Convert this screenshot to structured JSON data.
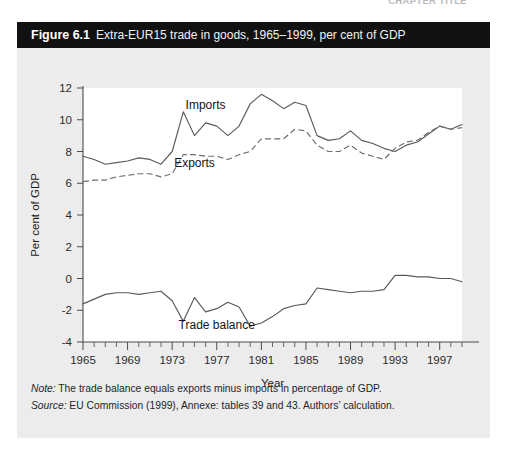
{
  "page_header": {
    "running_head": "CHAPTER TITLE",
    "page_number": ""
  },
  "figure": {
    "number": "Figure 6.1",
    "title": "Extra-EUR15 trade in goods, 1965–1999, per cent of GDP",
    "notes": [
      {
        "lead": "Note:",
        "text": " The trade balance equals exports minus imports in percentage of GDP."
      },
      {
        "lead": "Source:",
        "text": " EU Commission (1999), Annexe: tables 39 and 43. Authors’ calculation."
      }
    ]
  },
  "chart_data": {
    "type": "line",
    "title": "Extra-EUR15 trade in goods, 1965–1999, per cent of GDP",
    "xlabel": "Year",
    "ylabel": "Per cent of GDP",
    "xlim": [
      1965,
      1999
    ],
    "ylim": [
      -4,
      12
    ],
    "yticks": [
      -4,
      -2,
      0,
      2,
      4,
      6,
      8,
      10,
      12
    ],
    "xticks": [
      1965,
      1969,
      1973,
      1977,
      1981,
      1985,
      1989,
      1993,
      1997
    ],
    "xtick_minor_step": 1,
    "grid": false,
    "legend": "inline-annotations",
    "x": [
      1965,
      1966,
      1967,
      1968,
      1969,
      1970,
      1971,
      1972,
      1973,
      1974,
      1975,
      1976,
      1977,
      1978,
      1979,
      1980,
      1981,
      1982,
      1983,
      1984,
      1985,
      1986,
      1987,
      1988,
      1989,
      1990,
      1991,
      1992,
      1993,
      1994,
      1995,
      1996,
      1997,
      1998,
      1999
    ],
    "series": [
      {
        "name": "Imports",
        "style": "solid",
        "values": [
          7.7,
          7.5,
          7.2,
          7.3,
          7.4,
          7.6,
          7.5,
          7.2,
          8.0,
          10.5,
          9.0,
          9.8,
          9.6,
          9.0,
          9.6,
          11.0,
          11.6,
          11.2,
          10.7,
          11.1,
          10.9,
          9.0,
          8.7,
          8.8,
          9.3,
          8.7,
          8.5,
          8.2,
          8.0,
          8.4,
          8.6,
          9.1,
          9.6,
          9.4,
          9.7
        ]
      },
      {
        "name": "Exports",
        "style": "dashed",
        "values": [
          6.1,
          6.2,
          6.2,
          6.4,
          6.5,
          6.6,
          6.6,
          6.4,
          6.6,
          7.8,
          7.8,
          7.7,
          7.7,
          7.5,
          7.8,
          8.0,
          8.8,
          8.8,
          8.8,
          9.4,
          9.3,
          8.4,
          8.0,
          8.0,
          8.4,
          7.9,
          7.7,
          7.5,
          8.2,
          8.6,
          8.7,
          9.2,
          9.6,
          9.4,
          9.5
        ]
      },
      {
        "name": "Trade balance",
        "style": "solid",
        "values": [
          -1.6,
          -1.3,
          -1.0,
          -0.9,
          -0.9,
          -1.0,
          -0.9,
          -0.8,
          -1.4,
          -2.7,
          -1.2,
          -2.1,
          -1.9,
          -1.5,
          -1.8,
          -3.0,
          -2.8,
          -2.4,
          -1.9,
          -1.7,
          -1.6,
          -0.6,
          -0.7,
          -0.8,
          -0.9,
          -0.8,
          -0.8,
          -0.7,
          0.2,
          0.2,
          0.1,
          0.1,
          0.0,
          0.0,
          -0.2
        ]
      }
    ],
    "annotations": [
      {
        "text": "Imports",
        "x": 1976.0,
        "y": 10.7
      },
      {
        "text": "Exports",
        "x": 1975.0,
        "y": 7.0
      },
      {
        "text": "Trade balance",
        "x": 1977.0,
        "y": -3.2
      }
    ]
  }
}
